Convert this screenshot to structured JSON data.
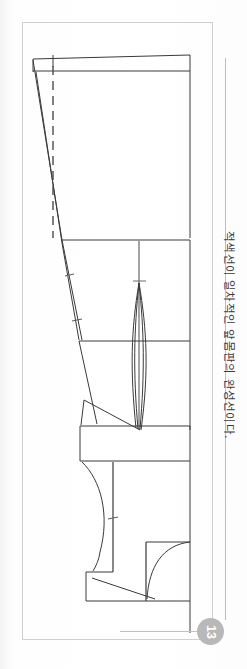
{
  "page": {
    "number": "13",
    "caption": "적색선이 일차적인 앞몸판의 완성선이다.",
    "orientation": "rotated-90-cw",
    "background_color": "#ffffff",
    "border_color": "#cfcfcf",
    "badge_color": "#b8b8b8",
    "badge_text_color": "#ffffff",
    "line_color": "#3a3a3a",
    "guide_color": "#808080"
  },
  "figure": {
    "type": "sewing-pattern-draft",
    "elements": [
      {
        "name": "center-front-line",
        "kind": "solid-line"
      },
      {
        "name": "shoulder-line",
        "kind": "solid-line"
      },
      {
        "name": "bust-line",
        "kind": "solid-line"
      },
      {
        "name": "waist-line",
        "kind": "solid-line"
      },
      {
        "name": "hip-line",
        "kind": "solid-line"
      },
      {
        "name": "side-seam-line",
        "kind": "solid-line"
      },
      {
        "name": "grain-line",
        "kind": "dashed-line"
      },
      {
        "name": "waist-dart",
        "kind": "dart"
      },
      {
        "name": "bust-dart",
        "kind": "dart"
      },
      {
        "name": "armhole-curve",
        "kind": "curve"
      },
      {
        "name": "neckline-curve",
        "kind": "curve"
      },
      {
        "name": "notch-mark",
        "kind": "tick"
      }
    ]
  }
}
